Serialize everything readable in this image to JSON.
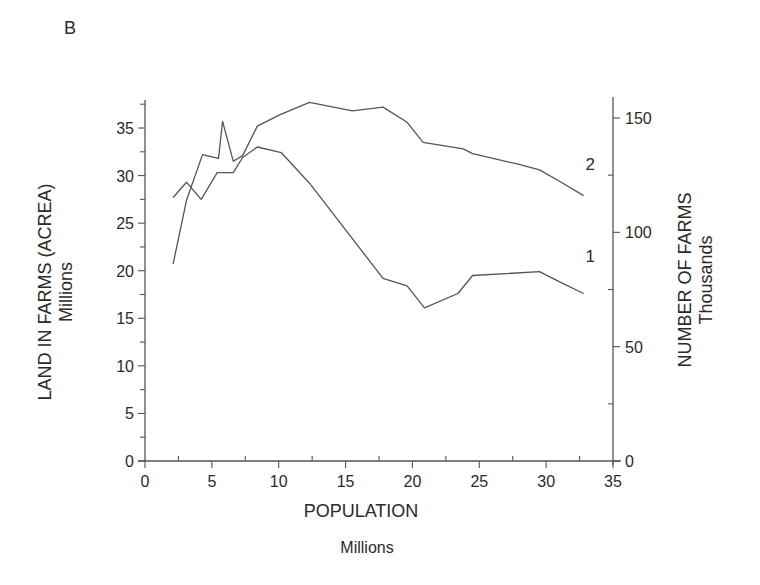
{
  "panel_label": "B",
  "chart_data": {
    "type": "line",
    "title": "",
    "xlabel": "POPULATION",
    "xlabel_units": "Millions",
    "ylabel": "LAND IN FARMS (ACREA)",
    "ylabel_units": "Millions",
    "y2label": "NUMBER OF FARMS",
    "y2label_units": "Thousands",
    "xlim": [
      0,
      35
    ],
    "ylim": [
      0,
      35
    ],
    "y2lim": [
      0,
      150
    ],
    "x_ticks": [
      0,
      5,
      10,
      15,
      20,
      25,
      30,
      35
    ],
    "y_ticks": [
      0,
      5,
      10,
      15,
      20,
      25,
      30,
      35
    ],
    "y2_ticks": [
      0,
      50,
      100,
      150
    ],
    "grid": false,
    "legend": "inline labels at line ends",
    "series": [
      {
        "name": "1",
        "axis": "left",
        "label_position": {
          "x": 33.3,
          "y": 20.9
        },
        "points": [
          [
            2.1,
            27.7
          ],
          [
            3.1,
            29.3
          ],
          [
            4.2,
            27.5
          ],
          [
            5.4,
            30.3
          ],
          [
            6.6,
            30.3
          ],
          [
            7.3,
            31.9
          ],
          [
            8.4,
            33.0
          ],
          [
            10.2,
            32.4
          ],
          [
            12.3,
            29.2
          ],
          [
            17.8,
            19.2
          ],
          [
            19.6,
            18.4
          ],
          [
            20.9,
            16.1
          ],
          [
            23.4,
            17.6
          ],
          [
            24.5,
            19.5
          ],
          [
            29.5,
            19.9
          ],
          [
            31.2,
            18.7
          ],
          [
            32.8,
            17.6
          ]
        ]
      },
      {
        "name": "2",
        "axis": "left",
        "label_position": {
          "x": 33.3,
          "y": 30.6
        },
        "points": [
          [
            2.1,
            20.7
          ],
          [
            3.1,
            27.4
          ],
          [
            4.3,
            32.2
          ],
          [
            5.5,
            31.8
          ],
          [
            5.8,
            35.7
          ],
          [
            6.6,
            31.5
          ],
          [
            7.3,
            32.1
          ],
          [
            8.4,
            35.2
          ],
          [
            10.1,
            36.4
          ],
          [
            12.3,
            37.7
          ],
          [
            15.5,
            36.8
          ],
          [
            17.8,
            37.2
          ],
          [
            19.6,
            35.6
          ],
          [
            20.8,
            33.5
          ],
          [
            23.8,
            32.8
          ],
          [
            24.5,
            32.3
          ],
          [
            27.9,
            31.2
          ],
          [
            29.5,
            30.6
          ],
          [
            31.0,
            29.4
          ],
          [
            32.8,
            27.9
          ]
        ]
      }
    ]
  }
}
